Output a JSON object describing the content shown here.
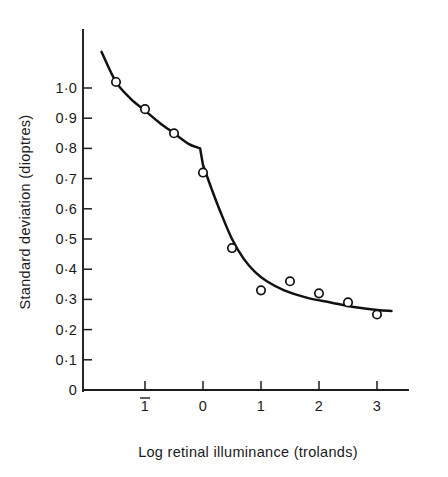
{
  "chart_data": {
    "type": "scatter",
    "title": "",
    "xlabel": "Log retinal illuminance (trolands)",
    "ylabel": "Standard deviation (dioptres)",
    "xlim": [
      -1.9,
      3.45
    ],
    "ylim": [
      0,
      1.14
    ],
    "grid": false,
    "legend": null,
    "x_tick_labels": [
      "1",
      "0",
      "1",
      "2",
      "3"
    ],
    "x_tick_values": [
      -1,
      0,
      1,
      2,
      3
    ],
    "x_first_tick_has_overbar": true,
    "y_tick_labels": [
      "0",
      "0·1",
      "0·2",
      "0·3",
      "0·4",
      "0·5",
      "0·6",
      "0·7",
      "0·8",
      "0·9",
      "1·0"
    ],
    "y_tick_values": [
      0,
      0.1,
      0.2,
      0.3,
      0.4,
      0.5,
      0.6,
      0.7,
      0.8,
      0.9,
      1.0
    ],
    "series": [
      {
        "name": "Standard deviation of accommodation",
        "marker": "open-circle",
        "x": [
          -1.5,
          -1.0,
          -0.5,
          0.0,
          0.5,
          1.0,
          1.5,
          2.0,
          2.5,
          3.0
        ],
        "values": [
          1.02,
          0.93,
          0.85,
          0.72,
          0.47,
          0.33,
          0.36,
          0.32,
          0.29,
          0.25
        ]
      },
      {
        "name": "Fitted curve",
        "marker": "none",
        "x": [
          -1.75,
          -1.5,
          -1.25,
          -1.0,
          -0.75,
          -0.5,
          -0.25,
          -0.05,
          0.0,
          0.15,
          0.3,
          0.5,
          0.7,
          0.9,
          1.1,
          1.4,
          1.8,
          2.2,
          2.6,
          3.0,
          3.25
        ],
        "values": [
          1.12,
          1.02,
          0.965,
          0.925,
          0.885,
          0.85,
          0.815,
          0.8,
          0.745,
          0.665,
          0.59,
          0.5,
          0.435,
          0.39,
          0.36,
          0.33,
          0.305,
          0.29,
          0.275,
          0.265,
          0.262
        ]
      }
    ],
    "colors": {
      "axis": "#1c1c1c",
      "curve": "#111111",
      "marker_fill": "#ffffff",
      "marker_stroke": "#111111",
      "background": "#ffffff",
      "text": "#1a1a1a"
    }
  }
}
